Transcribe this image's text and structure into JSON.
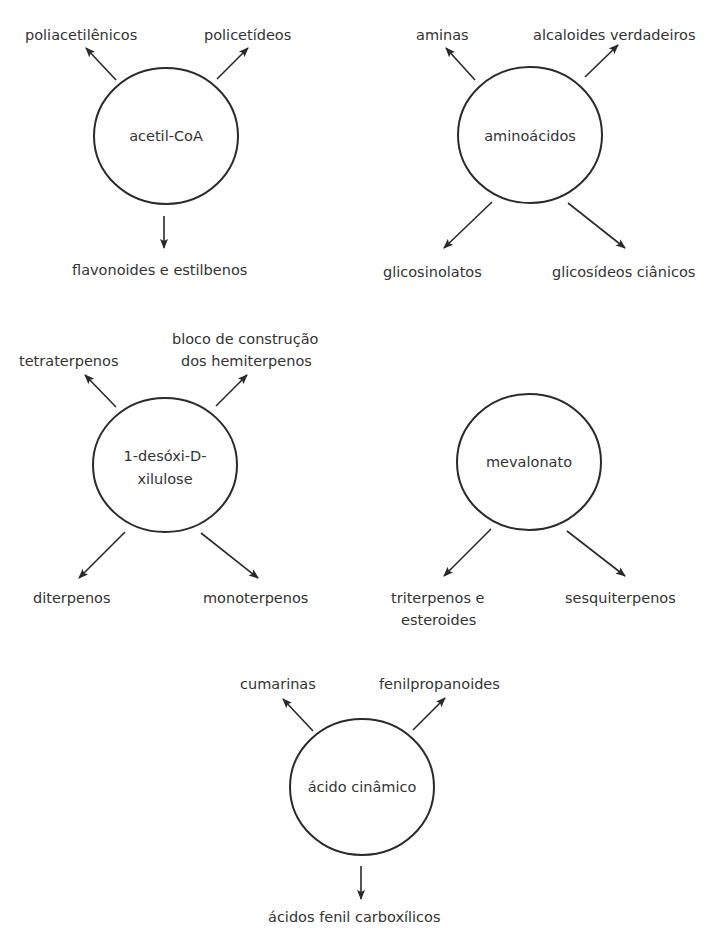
{
  "diagram": {
    "nodes": [
      {
        "id": "acetil-coa",
        "label_lines": [
          "acetil-CoA"
        ],
        "products": [
          {
            "label_lines": [
              "poliacetilênicos"
            ],
            "direction": "up-left"
          },
          {
            "label_lines": [
              "policetídeos"
            ],
            "direction": "up-right"
          },
          {
            "label_lines": [
              "flavonoides e estilbenos"
            ],
            "direction": "down"
          }
        ]
      },
      {
        "id": "aminoacidos",
        "label_lines": [
          "aminoácidos"
        ],
        "products": [
          {
            "label_lines": [
              "aminas"
            ],
            "direction": "up-left"
          },
          {
            "label_lines": [
              "alcaloides verdadeiros"
            ],
            "direction": "up-right"
          },
          {
            "label_lines": [
              "glicosinolatos"
            ],
            "direction": "down-left"
          },
          {
            "label_lines": [
              "glicosídeos ciânicos"
            ],
            "direction": "down-right"
          }
        ]
      },
      {
        "id": "desoxi-xilulose",
        "label_lines": [
          "1-desóxi-D-",
          "xilulose"
        ],
        "products": [
          {
            "label_lines": [
              "tetraterpenos"
            ],
            "direction": "up-left"
          },
          {
            "label_lines": [
              "bloco de construção",
              "dos hemiterpenos"
            ],
            "direction": "up-right"
          },
          {
            "label_lines": [
              "diterpenos"
            ],
            "direction": "down-left"
          },
          {
            "label_lines": [
              "monoterpenos"
            ],
            "direction": "down-right"
          }
        ]
      },
      {
        "id": "mevalonato",
        "label_lines": [
          "mevalonato"
        ],
        "products": [
          {
            "label_lines": [
              "triterpenos e",
              "esteroides"
            ],
            "direction": "down-left"
          },
          {
            "label_lines": [
              "sesquiterpenos"
            ],
            "direction": "down-right"
          }
        ]
      },
      {
        "id": "acido-cinamico",
        "label_lines": [
          "ácido cinâmico"
        ],
        "products": [
          {
            "label_lines": [
              "cumarinas"
            ],
            "direction": "up-left"
          },
          {
            "label_lines": [
              "fenilpropanoides"
            ],
            "direction": "up-right"
          },
          {
            "label_lines": [
              "ácidos fenil carboxílicos"
            ],
            "direction": "down"
          }
        ]
      }
    ],
    "colors": {
      "stroke": "#2a2a2a",
      "text": "#333333",
      "background": "#ffffff"
    }
  }
}
